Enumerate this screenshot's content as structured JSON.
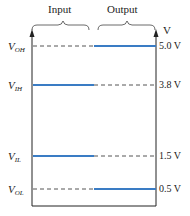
{
  "diagram": {
    "headers": {
      "input": "Input",
      "output": "Output"
    },
    "unit_label": "V",
    "colors": {
      "active_line": "#3a7cc4",
      "dashed_line": "#555555",
      "axis": "#222222"
    },
    "levels": [
      {
        "name": "V",
        "sub": "OH",
        "value": "5.0 V",
        "y": 46,
        "active_side": "output"
      },
      {
        "name": "V",
        "sub": "IH",
        "value": "3.8 V",
        "y": 85,
        "active_side": "input"
      },
      {
        "name": "V",
        "sub": "IL",
        "value": "1.5 V",
        "y": 156,
        "active_side": "input"
      },
      {
        "name": "V",
        "sub": "OL",
        "value": "0.5 V",
        "y": 189,
        "active_side": "output"
      }
    ]
  }
}
